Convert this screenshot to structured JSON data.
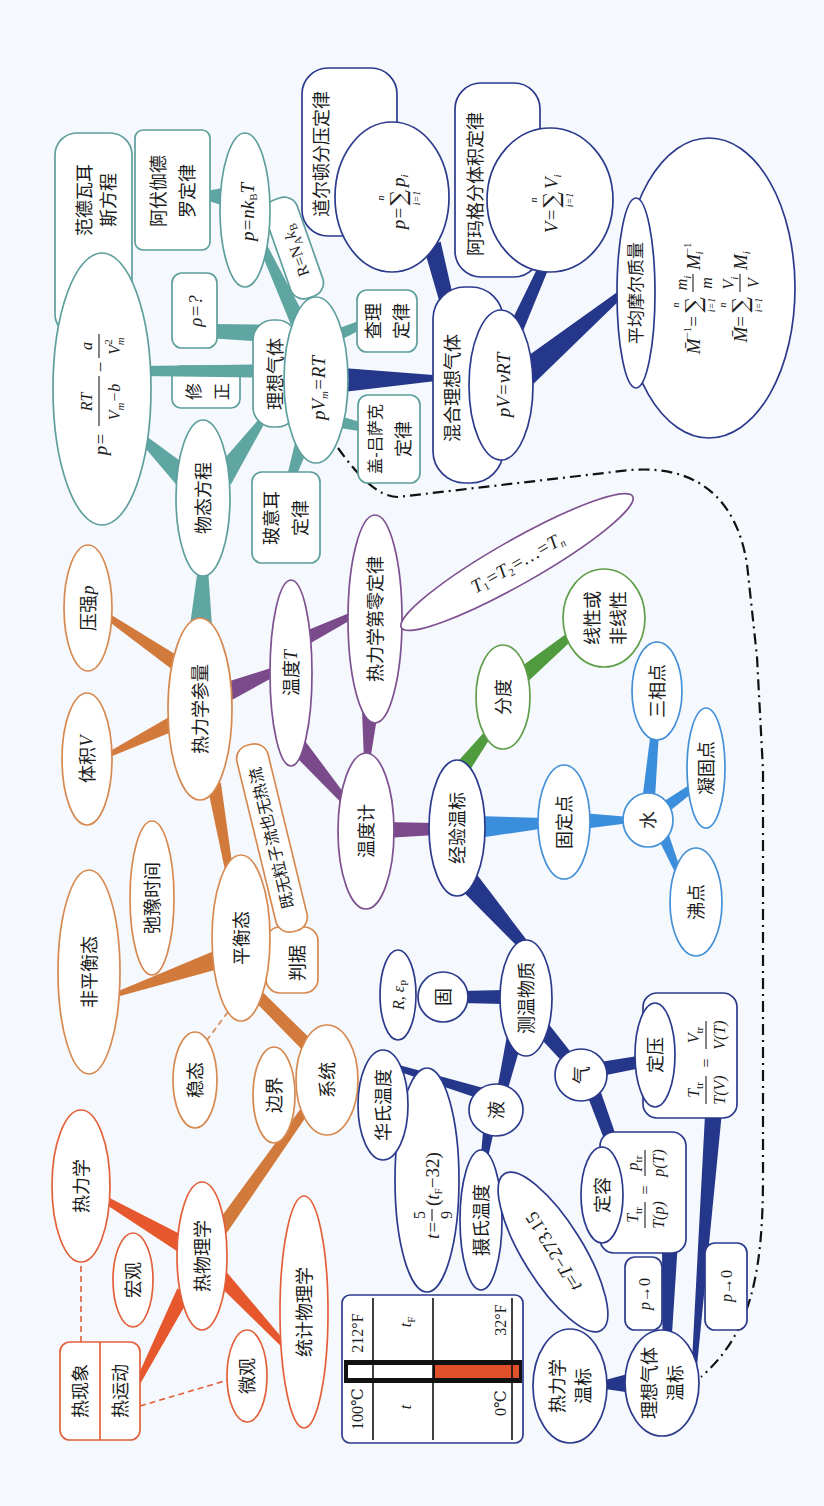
{
  "branch_colors": {
    "thermal_physics": "#e6572d",
    "equilibrium_and_parameters": "#d27a3c",
    "equation_of_state": "#5fa5a1",
    "mixtures_and_temperature_scales": "#24378b",
    "temperature": "#7a4a8b",
    "fixed_points": "#3b8edc",
    "graduation": "#4f9b3e",
    "mercury": "#e0502a"
  },
  "root": {
    "phenomenon": "热现象",
    "motion": "热运动"
  },
  "overview": {
    "thermodynamics": "热力学",
    "macroscopic": "宏观",
    "thermal_physics": "热物理学",
    "microscopic": "微观",
    "statistical_physics": "统计物理学"
  },
  "equilibrium": {
    "system": "系统",
    "boundary": "边界",
    "steady_state": "稳态",
    "equilibrium_state": "平衡态",
    "criterion": "判据",
    "criterion_condition": "既无粒子流也无热流",
    "relaxation_time": "弛豫时间",
    "non_equilibrium_state": "非平衡态"
  },
  "parameters": {
    "label": "热力学参量",
    "volume": {
      "label": "体积",
      "symbol": "V"
    },
    "pressure": {
      "label": "压强",
      "symbol": "p"
    },
    "temperature": {
      "label": "温度",
      "symbol": "T"
    }
  },
  "state_equation": {
    "label": "物态方程",
    "van_der_waals_name": [
      "范德瓦耳",
      "斯方程"
    ],
    "van_der_waals_formula": {
      "lhs": "p=",
      "num1": "RT",
      "den1_var": "V",
      "den1_sub": "m",
      "den1_rest": "−b",
      "minus": "−",
      "num2": "a",
      "den2_var": "V",
      "den2_sup": "2",
      "den2_sub": "m"
    },
    "correction": [
      "修",
      "正"
    ],
    "ideal_gas": "理想气体",
    "density": "ρ=?",
    "ideal_gas_law": {
      "lhs": "pV",
      "sub": "m",
      "rhs": "=RT"
    },
    "pressure_number_density": {
      "lhs": "p=nk",
      "sub": "B",
      "rhs": "T"
    },
    "avogadro_law": [
      "阿伏伽德",
      "罗定律"
    ],
    "gas_constant": {
      "a": "R=N",
      "sub_a": "A",
      "b": "k",
      "sub_b": "B"
    },
    "boyle_law": [
      "玻意耳",
      "定律"
    ],
    "charles_law": [
      "查理",
      "定律"
    ],
    "gay_lussac_law": [
      "盖-吕萨克",
      "定律"
    ]
  },
  "mixture": {
    "label": "混合理想气体",
    "equation": "pV=νRT",
    "dalton_law": "道尔顿分压定律",
    "dalton_formula": {
      "lhs": "p=",
      "sum": "∑",
      "upper": "n",
      "lower": "i=1",
      "term": "p",
      "term_sub": "i"
    },
    "amagat_law": "阿玛格分体积定律",
    "amagat_formula": {
      "lhs": "V=",
      "sum": "∑",
      "upper": "n",
      "lower": "i=1",
      "term": "V",
      "term_sub": "i"
    },
    "mean_molar_mass": "平均摩尔质量",
    "molar_formula_1": {
      "lhs": "M̄",
      "lhs_sup": "−1",
      "eq": "=",
      "sum": "∑",
      "upper": "n",
      "lower": "i=1",
      "num": "m",
      "num_sub": "i",
      "den": "m",
      "term": "M",
      "term_sup": "−1",
      "term_sub": "i"
    },
    "molar_formula_2": {
      "lhs": "M̄",
      "eq": "=",
      "sum": "∑",
      "upper": "n",
      "lower": "i=1",
      "num": "V",
      "num_sub": "i",
      "den": "V",
      "term": "M",
      "term_sub": "i"
    }
  },
  "temperature": {
    "zeroth_law": "热力学第零定律",
    "equality": {
      "a": "T",
      "a_sub": "1",
      "b": "=T",
      "b_sub": "2",
      "c": "=…=T",
      "c_sub": "n"
    },
    "thermometer": "温度计",
    "empirical_scale": "经验温标",
    "graduation": "分度",
    "linearity": [
      "线性或",
      "非线性"
    ],
    "fixed_point": "固定点",
    "water": "水",
    "triple_point": "三相点",
    "freezing_point": "凝固点",
    "boiling_point": "沸点",
    "thermometric_substance": "测温物质",
    "solid": "固",
    "solid_property": {
      "a": "R, ε",
      "sub": "P"
    },
    "liquid": "液",
    "fahrenheit": "华氏温度",
    "fahrenheit_formula": {
      "lhs": "t=",
      "num": "5",
      "den": "9",
      "open": "(",
      "var": "t",
      "sub": "F",
      "rest": "−32)"
    },
    "celsius": "摄氏温度",
    "celsius_formula": {
      "a": "t",
      "eq": "=",
      "b": "T",
      "rest": "−273.15"
    },
    "gas": "气",
    "constant_pressure": "定压",
    "constant_pressure_formula": {
      "num1": "T",
      "num1_sub": "tr",
      "den1": "T(V)",
      "eq": "=",
      "num2": "V",
      "num2_sub": "tr",
      "den2": "V(T)"
    },
    "constant_volume": "定容",
    "constant_volume_formula": {
      "num1": "T",
      "num1_sub": "tr",
      "den1": "T(p)",
      "eq": "=",
      "num2": "p",
      "num2_sub": "tr",
      "den2": "p(T)"
    },
    "limit_volume": {
      "var": "p",
      "rest": "→0"
    },
    "limit_pressure": {
      "var": "p",
      "rest": "→0"
    },
    "thermodynamic_scale": [
      "热力学",
      "温标"
    ],
    "ideal_gas_scale": [
      "理想气体",
      "温标"
    ]
  },
  "thermometer_figure": {
    "celsius_high": "100℃",
    "fahrenheit_high": "212°F",
    "celsius_var": "t",
    "fahrenheit_var": "t",
    "fahrenheit_var_sub": "F",
    "celsius_low": "0℃",
    "fahrenheit_low": "32°F"
  }
}
